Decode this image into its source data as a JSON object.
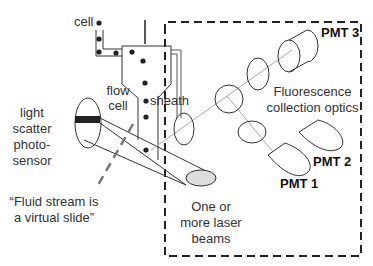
{
  "diagram": {
    "colors": {
      "stroke": "#333333",
      "dashed_box": "#222222",
      "light_path": "#aaaaaa",
      "guide_dash": "#777777",
      "photosensor_band": "#222222",
      "laser_spot_fill": "#dddddd"
    },
    "labels": {
      "cell": "cell",
      "flow_cell_line1": "flow",
      "flow_cell_line2": "cell",
      "sheath": "sheath",
      "light_scatter_line1": "light",
      "light_scatter_line2": "scatter",
      "light_scatter_line3": "photo-",
      "light_scatter_line4": "sensor",
      "quote_line1": "“Fluid stream is",
      "quote_line2": "a virtual slide”",
      "laser_line1": "One or",
      "laser_line2": "more laser",
      "laser_line3": "beams",
      "fluorescence_line1": "Fluorescence",
      "fluorescence_line2": "collection optics",
      "pmt1": "PMT 1",
      "pmt2": "PMT 2",
      "pmt3": "PMT 3"
    }
  }
}
